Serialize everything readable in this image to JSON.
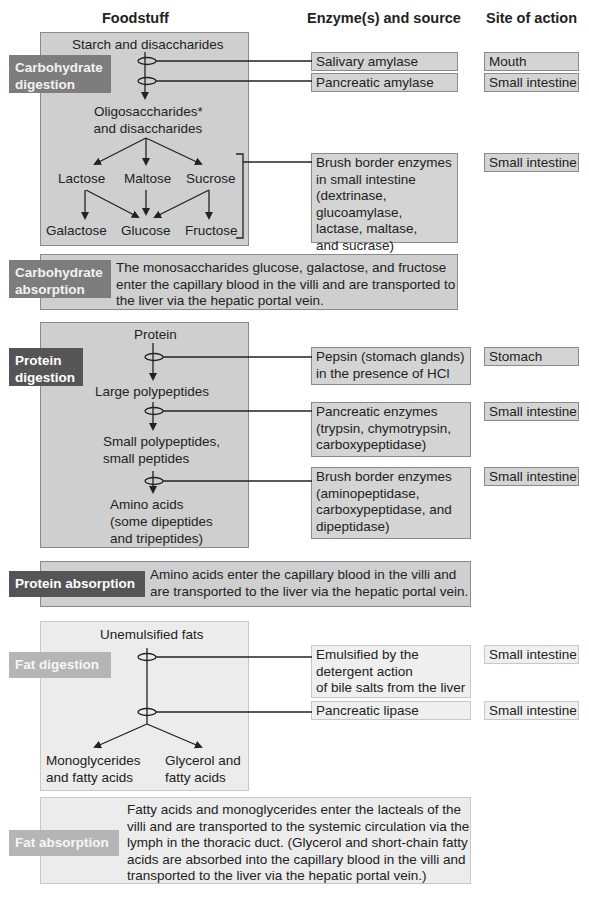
{
  "headers": {
    "foodstuff": "Foodstuff",
    "enzyme": "Enzyme(s) and source",
    "site": "Site of action"
  },
  "carbohydrate": {
    "digestion_label": [
      "Carbohydrate",
      "digestion"
    ],
    "absorption_label": [
      "Carbohydrate",
      "absorption"
    ],
    "nodes": {
      "start": "Starch and disaccharides",
      "oligo": [
        "Oligosaccharides*",
        "and disaccharides"
      ],
      "lactose": "Lactose",
      "maltose": "Maltose",
      "sucrose": "Sucrose",
      "galactose": "Galactose",
      "glucose": "Glucose",
      "fructose": "Fructose"
    },
    "enzymes": [
      {
        "lines": [
          "Salivary amylase"
        ],
        "site": "Mouth"
      },
      {
        "lines": [
          "Pancreatic amylase"
        ],
        "site": "Small intestine"
      },
      {
        "lines": [
          "Brush border enzymes",
          "in small intestine",
          "(dextrinase,",
          "glucoamylase,",
          "lactase, maltase,",
          "and sucrase)"
        ],
        "site": "Small intestine"
      }
    ],
    "absorption_text": [
      "The monosaccharides glucose, galactose, and fructose",
      "enter the capillary blood in the villi and are transported to",
      "the liver via the hepatic portal vein."
    ]
  },
  "protein": {
    "digestion_label": [
      "Protein",
      "digestion"
    ],
    "absorption_label": "Protein absorption",
    "nodes": {
      "start": "Protein",
      "large": "Large polypeptides",
      "small": [
        "Small polypeptides,",
        "small peptides"
      ],
      "amino": [
        "Amino acids",
        "(some dipeptides",
        "and tripeptides)"
      ]
    },
    "enzymes": [
      {
        "lines": [
          "Pepsin (stomach glands)",
          "in the presence of HCl"
        ],
        "site": "Stomach"
      },
      {
        "lines": [
          "Pancreatic enzymes",
          "(trypsin, chymotrypsin,",
          "carboxypeptidase)"
        ],
        "site": "Small intestine"
      },
      {
        "lines": [
          "Brush border enzymes",
          "(aminopeptidase,",
          "carboxypeptidase, and",
          "dipeptidase)"
        ],
        "site": "Small intestine"
      }
    ],
    "absorption_text": [
      "Amino acids enter the capillary blood in the villi and",
      "are transported to the liver via the hepatic portal vein."
    ]
  },
  "fat": {
    "digestion_label": "Fat digestion",
    "absorption_label": "Fat absorption",
    "nodes": {
      "start": "Unemulsified fats",
      "mono": [
        "Monoglycerides",
        "and fatty acids"
      ],
      "glycerol": [
        "Glycerol and",
        "fatty acids"
      ]
    },
    "enzymes": [
      {
        "lines": [
          "Emulsified by the",
          "detergent action",
          "of bile salts from the liver"
        ],
        "site": "Small intestine"
      },
      {
        "lines": [
          "Pancreatic lipase"
        ],
        "site": "Small intestine"
      }
    ],
    "absorption_text": [
      "Fatty acids and monoglycerides enter the lacteals of the",
      "villi and are transported to the systemic circulation via the",
      "lymph in the thoracic duct. (Glycerol and short-chain fatty",
      "acids are absorbed into the capillary blood in the villi and",
      "transported to the liver via the hepatic portal vein.)"
    ]
  },
  "colors": {
    "panel_dark": "#cfcfcf",
    "panel_light": "#ececec",
    "label_carb": "#7d7d7d",
    "label_protein": "#555555",
    "label_fat": "#b5b5b5"
  }
}
